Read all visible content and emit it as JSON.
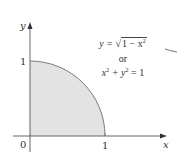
{
  "diagram": {
    "axes": {
      "x_label": "x",
      "y_label": "y",
      "origin_label": "0",
      "x_tick_label": "1",
      "y_tick_label": "1"
    },
    "equation": {
      "line1_lhs": "y = ",
      "line1_radicand": "1 − x",
      "line1_exp": "2",
      "connector": "or",
      "line3_a": "x",
      "line3_a_exp": "2",
      "line3_plus": " + y",
      "line3_b_exp": "2",
      "line3_rhs": " = 1"
    },
    "colors": {
      "fill": "#e3e3e3",
      "curve": "#777777",
      "axis": "#555555",
      "text": "#333333"
    }
  }
}
